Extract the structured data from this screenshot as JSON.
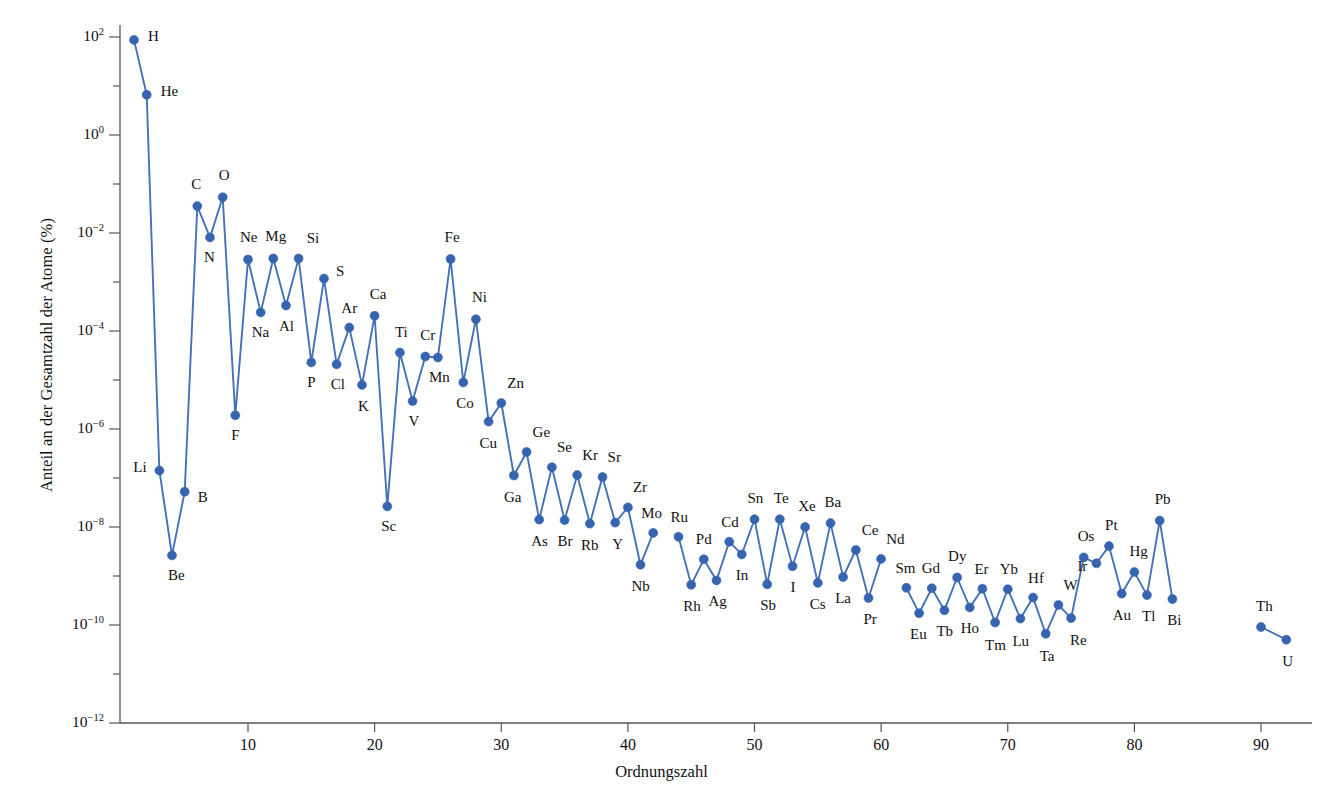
{
  "chart_data": {
    "type": "scatter",
    "title": "",
    "subtitle": "",
    "xlabel": "Ordnungszahl",
    "ylabel": "Anteil an der Gesamtzahl der Atome (%)",
    "xlim": [
      0,
      95
    ],
    "ylim_exp": [
      -12,
      2
    ],
    "yscale": "log",
    "grid": false,
    "legend": null,
    "xticks": [
      10,
      20,
      30,
      40,
      50,
      60,
      70,
      80,
      90
    ],
    "xtick_labels": [
      "10",
      "20",
      "30",
      "40",
      "50",
      "60",
      "70",
      "80",
      "90"
    ],
    "yticks_exp": [
      2,
      0,
      -2,
      -4,
      -6,
      -8,
      -10,
      -12
    ],
    "ytick_labels": [
      "10²",
      "10⁰",
      "10⁻²",
      "10⁻⁴",
      "10⁻⁶",
      "10⁻⁸",
      "10⁻¹⁰",
      "10⁻¹²"
    ],
    "ytick_mantissa": [
      "10",
      "10",
      "10",
      "10",
      "10",
      "10",
      "10",
      "10"
    ],
    "ytick_exponent": [
      "2",
      "0",
      "−2",
      "−4",
      "−6",
      "−8",
      "−10",
      "−12"
    ],
    "series_name": "Elementhäufigkeit",
    "marker_color": "#3664AE",
    "line_color": "#4472B8",
    "marker_size_px": 9,
    "points": [
      {
        "z": 1,
        "el": "H",
        "exp": 1.94,
        "lx": 14,
        "ly": -4
      },
      {
        "z": 2,
        "el": "He",
        "exp": 0.82,
        "lx": 14,
        "ly": -4
      },
      {
        "z": 3,
        "el": "Li",
        "exp": -6.85,
        "lx": -26,
        "ly": -4
      },
      {
        "z": 4,
        "el": "Be",
        "exp": -8.58,
        "lx": -4,
        "ly": 20
      },
      {
        "z": 5,
        "el": "B",
        "exp": -7.28,
        "lx": 13,
        "ly": 5
      },
      {
        "z": 6,
        "el": "C",
        "exp": -1.45,
        "lx": -6,
        "ly": -22
      },
      {
        "z": 7,
        "el": "N",
        "exp": -2.09,
        "lx": -6,
        "ly": 20
      },
      {
        "z": 8,
        "el": "O",
        "exp": -1.27,
        "lx": -4,
        "ly": -22
      },
      {
        "z": 9,
        "el": "F",
        "exp": -5.72,
        "lx": -4,
        "ly": 20
      },
      {
        "z": 10,
        "el": "Ne",
        "exp": -2.54,
        "lx": -8,
        "ly": -22
      },
      {
        "z": 11,
        "el": "Na",
        "exp": -3.62,
        "lx": -9,
        "ly": 20
      },
      {
        "z": 12,
        "el": "Mg",
        "exp": -2.52,
        "lx": -8,
        "ly": -22
      },
      {
        "z": 13,
        "el": "Al",
        "exp": -3.48,
        "lx": -7,
        "ly": 20
      },
      {
        "z": 14,
        "el": "Si",
        "exp": -2.52,
        "lx": 8,
        "ly": -20
      },
      {
        "z": 15,
        "el": "P",
        "exp": -4.64,
        "lx": -4,
        "ly": 20
      },
      {
        "z": 16,
        "el": "S",
        "exp": -2.93,
        "lx": 12,
        "ly": -8
      },
      {
        "z": 17,
        "el": "Cl",
        "exp": -4.68,
        "lx": -6,
        "ly": 20
      },
      {
        "z": 18,
        "el": "Ar",
        "exp": -3.93,
        "lx": -8,
        "ly": -20
      },
      {
        "z": 19,
        "el": "K",
        "exp": -5.1,
        "lx": -4,
        "ly": 21
      },
      {
        "z": 20,
        "el": "Ca",
        "exp": -3.69,
        "lx": -5,
        "ly": -22
      },
      {
        "z": 21,
        "el": "Sc",
        "exp": -7.58,
        "lx": -6,
        "ly": 20
      },
      {
        "z": 22,
        "el": "Ti",
        "exp": -4.44,
        "lx": -5,
        "ly": -21
      },
      {
        "z": 23,
        "el": "V",
        "exp": -5.43,
        "lx": -4,
        "ly": 20
      },
      {
        "z": 24,
        "el": "Cr",
        "exp": -4.52,
        "lx": -5,
        "ly": -21
      },
      {
        "z": 25,
        "el": "Mn",
        "exp": -4.54,
        "lx": -9,
        "ly": 20
      },
      {
        "z": 26,
        "el": "Fe",
        "exp": -2.53,
        "lx": -6,
        "ly": -22
      },
      {
        "z": 27,
        "el": "Co",
        "exp": -5.05,
        "lx": -7,
        "ly": 21
      },
      {
        "z": 28,
        "el": "Ni",
        "exp": -3.76,
        "lx": -4,
        "ly": -22
      },
      {
        "z": 29,
        "el": "Cu",
        "exp": -5.85,
        "lx": -9,
        "ly": 21
      },
      {
        "z": 30,
        "el": "Zn",
        "exp": -5.47,
        "lx": 6,
        "ly": -20
      },
      {
        "z": 31,
        "el": "Ga",
        "exp": -6.95,
        "lx": -10,
        "ly": 21
      },
      {
        "z": 32,
        "el": "Ge",
        "exp": -6.47,
        "lx": 6,
        "ly": -20
      },
      {
        "z": 33,
        "el": "As",
        "exp": -7.85,
        "lx": -8,
        "ly": 21
      },
      {
        "z": 34,
        "el": "Se",
        "exp": -6.78,
        "lx": 5,
        "ly": -20
      },
      {
        "z": 35,
        "el": "Br",
        "exp": -7.86,
        "lx": -7,
        "ly": 21
      },
      {
        "z": 36,
        "el": "Kr",
        "exp": -6.94,
        "lx": 5,
        "ly": -20
      },
      {
        "z": 37,
        "el": "Rb",
        "exp": -7.93,
        "lx": -9,
        "ly": 21
      },
      {
        "z": 38,
        "el": "Sr",
        "exp": -6.98,
        "lx": 5,
        "ly": -20
      },
      {
        "z": 39,
        "el": "Y",
        "exp": -7.91,
        "lx": -3,
        "ly": 21
      },
      {
        "z": 40,
        "el": "Zr",
        "exp": -7.6,
        "lx": 5,
        "ly": -20
      },
      {
        "z": 41,
        "el": "Nb",
        "exp": -8.77,
        "lx": -9,
        "ly": 21
      },
      {
        "z": 42,
        "el": "Mo",
        "exp": -8.12,
        "lx": -12,
        "ly": -20
      },
      {
        "z": 44,
        "el": "Ru",
        "exp": -8.2,
        "lx": -8,
        "ly": -20
      },
      {
        "z": 45,
        "el": "Rh",
        "exp": -9.18,
        "lx": -8,
        "ly": 21
      },
      {
        "z": 46,
        "el": "Pd",
        "exp": -8.66,
        "lx": -8,
        "ly": -20
      },
      {
        "z": 47,
        "el": "Ag",
        "exp": -9.09,
        "lx": -8,
        "ly": 21
      },
      {
        "z": 48,
        "el": "Cd",
        "exp": -8.3,
        "lx": -8,
        "ly": -20
      },
      {
        "z": 49,
        "el": "In",
        "exp": -8.56,
        "lx": -6,
        "ly": 21
      },
      {
        "z": 50,
        "el": "Sn",
        "exp": -7.84,
        "lx": -7,
        "ly": -21
      },
      {
        "z": 51,
        "el": "Sb",
        "exp": -9.17,
        "lx": -7,
        "ly": 21
      },
      {
        "z": 52,
        "el": "Te",
        "exp": -7.84,
        "lx": -6,
        "ly": -21
      },
      {
        "z": 53,
        "el": "I",
        "exp": -8.8,
        "lx": -2,
        "ly": 21
      },
      {
        "z": 54,
        "el": "Xe",
        "exp": -8.0,
        "lx": -7,
        "ly": -21
      },
      {
        "z": 55,
        "el": "Cs",
        "exp": -9.14,
        "lx": -8,
        "ly": 21
      },
      {
        "z": 56,
        "el": "Ba",
        "exp": -7.92,
        "lx": -6,
        "ly": -21
      },
      {
        "z": 57,
        "el": "La",
        "exp": -9.02,
        "lx": -8,
        "ly": 21
      },
      {
        "z": 58,
        "el": "Ce",
        "exp": -8.47,
        "lx": 6,
        "ly": -20
      },
      {
        "z": 59,
        "el": "Pr",
        "exp": -9.45,
        "lx": -5,
        "ly": 21
      },
      {
        "z": 60,
        "el": "Nd",
        "exp": -8.65,
        "lx": 5,
        "ly": -20
      },
      {
        "z": 62,
        "el": "Sm",
        "exp": -9.24,
        "lx": -11,
        "ly": -20
      },
      {
        "z": 63,
        "el": "Eu",
        "exp": -9.76,
        "lx": -9,
        "ly": 21
      },
      {
        "z": 64,
        "el": "Gd",
        "exp": -9.25,
        "lx": -10,
        "ly": -20
      },
      {
        "z": 65,
        "el": "Tb",
        "exp": -9.7,
        "lx": -8,
        "ly": 21
      },
      {
        "z": 66,
        "el": "Dy",
        "exp": -9.03,
        "lx": -9,
        "ly": -21
      },
      {
        "z": 67,
        "el": "Ho",
        "exp": -9.64,
        "lx": -9,
        "ly": 21
      },
      {
        "z": 68,
        "el": "Er",
        "exp": -9.26,
        "lx": -8,
        "ly": -20
      },
      {
        "z": 69,
        "el": "Tm",
        "exp": -9.95,
        "lx": -10,
        "ly": 22
      },
      {
        "z": 70,
        "el": "Yb",
        "exp": -9.27,
        "lx": -8,
        "ly": -20
      },
      {
        "z": 71,
        "el": "Lu",
        "exp": -9.87,
        "lx": -8,
        "ly": 22
      },
      {
        "z": 72,
        "el": "Hf",
        "exp": -9.44,
        "lx": -5,
        "ly": -20
      },
      {
        "z": 73,
        "el": "Ta",
        "exp": -10.18,
        "lx": -6,
        "ly": 22
      },
      {
        "z": 74,
        "el": "W",
        "exp": -9.59,
        "lx": 5,
        "ly": -20
      },
      {
        "z": 75,
        "el": "Re",
        "exp": -9.86,
        "lx": -1,
        "ly": 22
      },
      {
        "z": 76,
        "el": "Os",
        "exp": -8.62,
        "lx": -6,
        "ly": -21
      },
      {
        "z": 77,
        "el": "Ir",
        "exp": -8.74,
        "lx": -19,
        "ly": 3
      },
      {
        "z": 78,
        "el": "Pt",
        "exp": -8.39,
        "lx": -4,
        "ly": -21
      },
      {
        "z": 79,
        "el": "Au",
        "exp": -9.36,
        "lx": -9,
        "ly": 21
      },
      {
        "z": 80,
        "el": "Hg",
        "exp": -8.92,
        "lx": -5,
        "ly": -21
      },
      {
        "z": 81,
        "el": "Tl",
        "exp": -9.39,
        "lx": -5,
        "ly": 21
      },
      {
        "z": 82,
        "el": "Pb",
        "exp": -7.87,
        "lx": -5,
        "ly": -22
      },
      {
        "z": 83,
        "el": "Bi",
        "exp": -9.47,
        "lx": -5,
        "ly": 21
      },
      {
        "z": 90,
        "el": "Th",
        "exp": -10.04,
        "lx": -5,
        "ly": -21
      },
      {
        "z": 92,
        "el": "U",
        "exp": -10.3,
        "lx": -4,
        "ly": 21
      }
    ],
    "segment_breaks": [
      42,
      60,
      83
    ]
  }
}
